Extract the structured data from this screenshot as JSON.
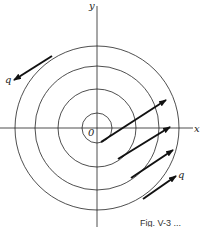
{
  "figure": {
    "axis_labels": {
      "x": "x",
      "y": "y",
      "origin": "0"
    },
    "vector_label_top": "q",
    "vector_label_bottom": "q",
    "caption": "Fig. V-3 ...",
    "circles": [
      15,
      39,
      62,
      82
    ],
    "center": [
      97,
      128
    ]
  }
}
